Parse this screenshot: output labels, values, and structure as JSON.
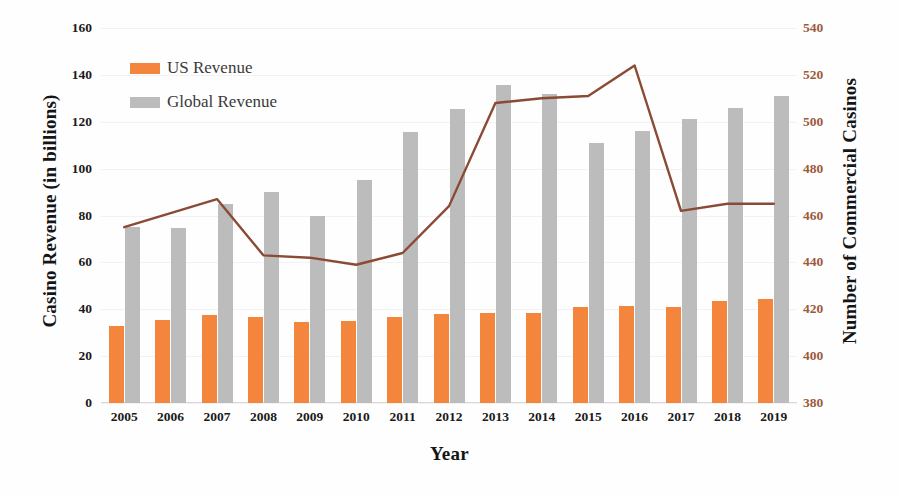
{
  "chart_data": {
    "type": "bar",
    "title": "",
    "xlabel": "Year",
    "ylabel": "Casino Revenue (in billions)",
    "y2label": "Number of Commercial Casinos",
    "categories": [
      "2005",
      "2006",
      "2007",
      "2008",
      "2009",
      "2010",
      "2011",
      "2012",
      "2013",
      "2014",
      "2015",
      "2016",
      "2017",
      "2018",
      "2019"
    ],
    "ylim": [
      0,
      160
    ],
    "yticks": [
      0,
      20,
      40,
      60,
      80,
      100,
      120,
      140,
      160
    ],
    "y2lim": [
      380,
      540
    ],
    "y2ticks": [
      380,
      400,
      420,
      440,
      460,
      480,
      500,
      520,
      540
    ],
    "grid": false,
    "legend_position": "upper-left",
    "series": [
      {
        "name": "US Revenue",
        "type": "bar",
        "axis": "left",
        "color": "#f4853c",
        "values": [
          33,
          35.5,
          37.5,
          36.5,
          34.5,
          35,
          36.5,
          38,
          38.5,
          38.5,
          41,
          41.5,
          41,
          43.5,
          44.5
        ]
      },
      {
        "name": "Global Revenue",
        "type": "bar",
        "axis": "left",
        "color": "#bcbcbc",
        "values": [
          75,
          74.5,
          85,
          90,
          80,
          95,
          115.5,
          125.5,
          135.5,
          132,
          111,
          116,
          121,
          126,
          131
        ]
      },
      {
        "name": "Number of Commercial Casinos",
        "type": "line",
        "axis": "right",
        "color": "#8b4a34",
        "values": [
          455,
          461,
          467,
          443,
          442,
          439,
          444,
          464,
          508,
          510,
          511,
          524,
          462,
          465,
          465
        ]
      }
    ]
  },
  "legend": {
    "items": [
      {
        "label": "US Revenue",
        "color": "#f4853c"
      },
      {
        "label": "Global Revenue",
        "color": "#bcbcbc"
      }
    ]
  },
  "axes": {
    "y_left": {
      "title": "Casino Revenue (in billions)",
      "ticks": [
        "160",
        "140",
        "120",
        "100",
        "80",
        "60",
        "40",
        "20",
        "0"
      ]
    },
    "y_right": {
      "title": "Number of Commercial Casinos",
      "ticks": [
        "540",
        "520",
        "500",
        "480",
        "460",
        "440",
        "420",
        "400",
        "380"
      ],
      "color": "#9c5a3c"
    },
    "x": {
      "title": "Year",
      "ticks": [
        "2005",
        "2006",
        "2007",
        "2008",
        "2009",
        "2010",
        "2011",
        "2012",
        "2013",
        "2014",
        "2015",
        "2016",
        "2017",
        "2018",
        "2019"
      ]
    }
  }
}
